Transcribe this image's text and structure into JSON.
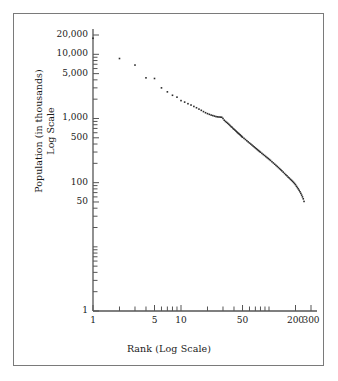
{
  "figure": {
    "background_color": "#ffffff",
    "frame_color": "#7a7a7a",
    "ink_color": "#1a1a1a"
  },
  "chart_data": {
    "type": "scatter",
    "title": "",
    "subtitle": "",
    "xlabel": "Rank (Log Scale)",
    "ylabel": "Population (in thousands)",
    "ylabel_line2": "Log Scale",
    "xscale": "log",
    "yscale": "log",
    "xlim": [
      1,
      300
    ],
    "ylim": [
      1,
      20000
    ],
    "grid": false,
    "legend": null,
    "legend_position": "none",
    "marker": "dot",
    "marker_color": "#2b2b2b",
    "marker_size": 1.6,
    "xticks": [
      1,
      2,
      3,
      4,
      5,
      6,
      7,
      8,
      9,
      10,
      20,
      30,
      40,
      50,
      60,
      70,
      80,
      90,
      100,
      200,
      300
    ],
    "xtick_labels": [
      {
        "value": 1,
        "label": "1"
      },
      {
        "value": 5,
        "label": "5"
      },
      {
        "value": 10,
        "label": "10"
      },
      {
        "value": 50,
        "label": "50"
      },
      {
        "value": 200,
        "label": "200"
      },
      {
        "value": 300,
        "label": "300"
      }
    ],
    "yticks": [
      1,
      2,
      3,
      4,
      5,
      6,
      7,
      8,
      9,
      10,
      20,
      30,
      40,
      50,
      60,
      70,
      80,
      90,
      100,
      200,
      300,
      400,
      500,
      600,
      700,
      800,
      900,
      1000,
      2000,
      3000,
      4000,
      5000,
      6000,
      7000,
      8000,
      9000,
      10000,
      20000
    ],
    "ytick_labels": [
      {
        "value": 1,
        "label": "1"
      },
      {
        "value": 50,
        "label": "50"
      },
      {
        "value": 100,
        "label": "100"
      },
      {
        "value": 500,
        "label": "500"
      },
      {
        "value": 1000,
        "label": "1,000"
      },
      {
        "value": 5000,
        "label": "5,000"
      },
      {
        "value": 10000,
        "label": "10,000"
      },
      {
        "value": 20000,
        "label": "20,000"
      }
    ],
    "x": [
      1,
      2,
      3,
      4,
      5,
      6,
      7,
      8,
      9,
      10,
      11,
      12,
      13,
      14,
      15,
      16,
      17,
      18,
      19,
      20,
      21,
      22,
      23,
      24,
      25,
      26,
      27,
      28,
      29,
      30,
      31,
      32,
      33,
      34,
      35,
      36,
      37,
      38,
      39,
      40,
      41,
      42,
      43,
      44,
      45,
      46,
      47,
      48,
      49,
      50,
      52,
      54,
      56,
      58,
      60,
      62,
      64,
      66,
      68,
      70,
      72,
      74,
      76,
      78,
      80,
      83,
      86,
      89,
      92,
      95,
      98,
      101,
      104,
      108,
      112,
      116,
      120,
      124,
      128,
      132,
      136,
      140,
      145,
      150,
      155,
      160,
      165,
      170,
      175,
      180,
      185,
      190,
      195,
      200,
      205,
      210,
      215,
      220,
      225,
      230,
      235,
      240,
      245,
      250
    ],
    "y": [
      17800,
      8600,
      6800,
      4300,
      4200,
      3000,
      2600,
      2300,
      2150,
      1900,
      1800,
      1700,
      1620,
      1540,
      1470,
      1400,
      1340,
      1280,
      1230,
      1190,
      1160,
      1130,
      1110,
      1090,
      1070,
      1060,
      1055,
      1050,
      1045,
      1000,
      940,
      900,
      870,
      840,
      810,
      780,
      750,
      730,
      700,
      680,
      660,
      640,
      620,
      600,
      585,
      570,
      555,
      540,
      525,
      510,
      490,
      470,
      450,
      432,
      415,
      400,
      386,
      372,
      360,
      348,
      337,
      326,
      316,
      307,
      298,
      286,
      275,
      265,
      255,
      246,
      238,
      230,
      222,
      212,
      203,
      194,
      186,
      179,
      172,
      165,
      159,
      153,
      146,
      139,
      133,
      128,
      122,
      118,
      113,
      109,
      105,
      101,
      97,
      93,
      88,
      84,
      80,
      76,
      72,
      68,
      64,
      60,
      56,
      51
    ]
  }
}
